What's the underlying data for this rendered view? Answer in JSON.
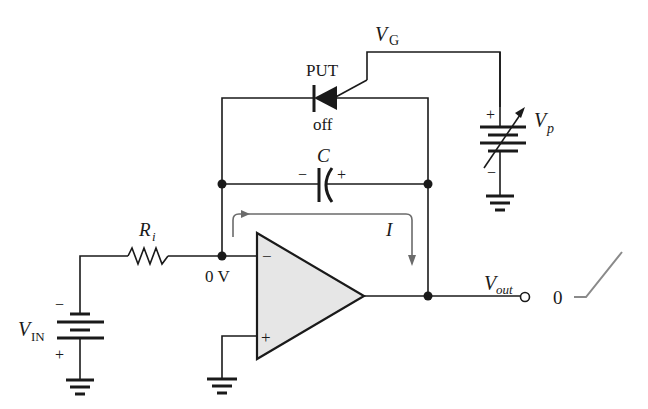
{
  "diagram": {
    "type": "circuit-schematic",
    "labels": {
      "vg": "V",
      "vg_sub": "G",
      "put": "PUT",
      "put_state": "off",
      "vp": "V",
      "vp_sub": "p",
      "vp_plus": "+",
      "vp_minus": "−",
      "cap": "C",
      "cap_minus": "−",
      "cap_plus": "+",
      "current": "I",
      "ri": "R",
      "ri_sub": "i",
      "node_voltage": "0 V",
      "vin": "V",
      "vin_sub": "IN",
      "vin_minus": "−",
      "vin_plus": "+",
      "opamp_inv": "−",
      "opamp_noninv": "+",
      "vout": "V",
      "vout_sub": "out",
      "waveform_zero": "0"
    },
    "components": [
      {
        "id": "PUT",
        "kind": "programmable unijunction transistor",
        "state": "off"
      },
      {
        "id": "C",
        "kind": "capacitor"
      },
      {
        "id": "Ri",
        "kind": "resistor"
      },
      {
        "id": "VIN",
        "kind": "dc source"
      },
      {
        "id": "Vp",
        "kind": "variable dc source"
      },
      {
        "id": "opamp",
        "kind": "operational amplifier"
      }
    ],
    "colors": {
      "line": "#1a1a1a",
      "opamp_fill": "#e6e6e6",
      "arrow": "#6b6b6b",
      "ramp": "#8a8a8a"
    }
  }
}
